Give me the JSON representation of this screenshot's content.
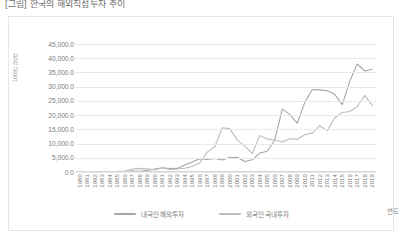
{
  "caption": "[그림] 한국의 해외직접투자 추이",
  "chart_data": {
    "type": "line",
    "title": "",
    "xlabel": "연도",
    "ylabel": "100만 달러",
    "ylim": [
      0,
      45000
    ],
    "ytick_step": 5000,
    "grid": true,
    "legend_position": "bottom",
    "ytick_labels": [
      "45,000.0",
      "40,000.0",
      "35,000.0",
      "30,000.0",
      "25,000.0",
      "20,000.0",
      "15,000.0",
      "10,000.0",
      "5,000.0",
      "0.0"
    ],
    "categories": [
      "1980",
      "1981",
      "1982",
      "1983",
      "1984",
      "1985",
      "1986",
      "1987",
      "1988",
      "1989",
      "1990",
      "1991",
      "1992",
      "1993",
      "1994",
      "1995",
      "1996",
      "1997",
      "1998",
      "1999",
      "2000",
      "2001",
      "2002",
      "2003",
      "2004",
      "2005",
      "2006",
      "2007",
      "2008",
      "2009",
      "2010",
      "2011",
      "2012",
      "2013",
      "2014",
      "2015",
      "2016",
      "2017",
      "2018",
      "2019"
    ],
    "series": [
      {
        "name": "내국인 해외투자",
        "color": "#a6a6a6",
        "values": [
          26,
          46,
          103,
          110,
          50,
          110,
          181,
          410,
          216,
          571,
          1052,
          1489,
          1217,
          1262,
          2461,
          3552,
          4670,
          4450,
          4740,
          4198,
          5074,
          5175,
          3692,
          4277,
          6655,
          7289,
          11175,
          22099,
          20251,
          17197,
          24445,
          28983,
          28864,
          28574,
          27304,
          23692,
          31850,
          38000,
          35500,
          36100
        ]
      },
      {
        "name": "외국인 국내투자",
        "color": "#bdbdbd",
        "values": [
          101,
          127,
          100,
          121,
          183,
          216,
          354,
          1060,
          1283,
          1090,
          803,
          1396,
          894,
          1044,
          1317,
          1947,
          3203,
          6971,
          8858,
          15542,
          15265,
          11292,
          9101,
          6468,
          12796,
          11566,
          11247,
          10515,
          11711,
          11484,
          13071,
          13673,
          16286,
          14548,
          19003,
          20910,
          21295,
          22948,
          26962,
          23329
        ]
      }
    ]
  },
  "legend": {
    "items": [
      {
        "label": "내국인 해외투자",
        "color": "#a6a6a6"
      },
      {
        "label": "외국인 국내투자",
        "color": "#bdbdbd"
      }
    ]
  }
}
